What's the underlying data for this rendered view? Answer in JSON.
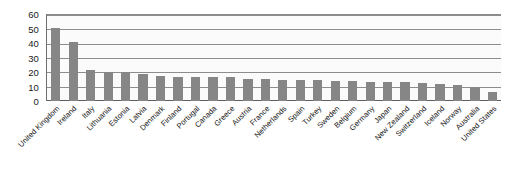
{
  "chart_data": {
    "type": "bar",
    "title": "",
    "subtitle": "",
    "xlabel": "",
    "ylabel": "",
    "ylim": [
      0,
      60
    ],
    "yticks": [
      0,
      10,
      20,
      30,
      40,
      50,
      60
    ],
    "grid": true,
    "legend": null,
    "bar_color": "#868686",
    "gridline_color": "#8d8d8d",
    "plot_background": "#fbfbfb",
    "categories": [
      "United Kingdom",
      "Ireland",
      "Italy",
      "Lithuania",
      "Estonia",
      "Latvia",
      "Denmark",
      "Finland",
      "Portugal",
      "Canada",
      "Greece",
      "Austria",
      "France",
      "Netherlands",
      "Spain",
      "Turkey",
      "Sweden",
      "Belgium",
      "Germany",
      "Japan",
      "New Zealand",
      "Switzerland",
      "Iceland",
      "Norway",
      "Australia",
      "United States"
    ],
    "values": [
      51,
      41.5,
      21.5,
      20.5,
      20,
      19,
      17.5,
      17,
      16.5,
      16.5,
      16.5,
      15.5,
      15.5,
      15,
      15,
      14.5,
      14,
      14,
      13.5,
      13.5,
      13,
      12.5,
      12,
      11,
      10,
      6
    ]
  }
}
